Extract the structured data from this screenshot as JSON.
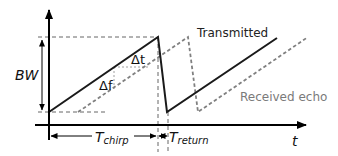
{
  "diagram": {
    "type": "fmcw-chirp-timing",
    "labels": {
      "bandwidth": "BW",
      "delta_t": "Δt",
      "delta_f": "Δf",
      "transmitted": "Transmitted",
      "received": "Received echo",
      "t_chirp_main": "T",
      "t_chirp_sub": "chirp",
      "t_return_main": "T",
      "t_return_sub": "return",
      "time_axis": "t"
    },
    "colors": {
      "transmitted": "#1a1a1a",
      "received": "#808080",
      "axis": "#000000",
      "guide": "#555555",
      "received_label": "#7a7a7a"
    }
  }
}
